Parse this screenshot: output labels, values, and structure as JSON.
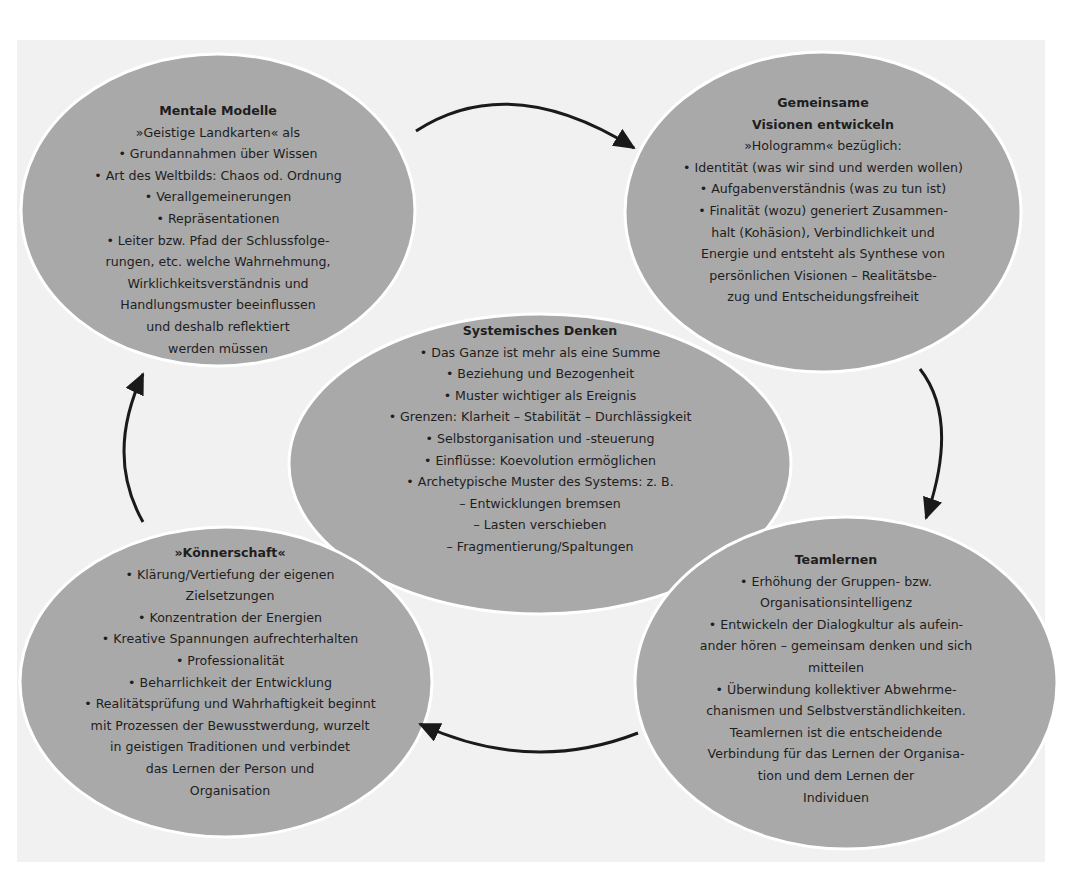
{
  "diagram": {
    "colors": {
      "background": "#f1f1f1",
      "bubble_fill": "#a9a9a9",
      "bubble_outline": "#ffffff",
      "arrow": "#1a1a1a",
      "text": "#1e1e1e"
    },
    "cycle_order": [
      "mental_models",
      "shared_vision",
      "team_learning",
      "personal_mastery"
    ],
    "nodes": {
      "mental_models": {
        "title": "Mentale Modelle",
        "lines": [
          "»Geistige Landkarten« als",
          "• Grundannahmen über Wissen",
          "• Art des Weltbilds: Chaos od. Ordnung",
          "• Verallgemeinerungen",
          "• Repräsentationen",
          "• Leiter bzw. Pfad der Schlussfolge-",
          "rungen, etc. welche Wahrnehmung,",
          "Wirklichkeitsverständnis und",
          "Handlungsmuster beeinflussen",
          "und deshalb reflektiert",
          "werden müssen"
        ]
      },
      "shared_vision": {
        "title_lines": [
          "Gemeinsame",
          "Visionen entwickeln"
        ],
        "lines": [
          "»Hologramm« bezüglich:",
          "• Identität (was wir sind und werden wollen)",
          "• Aufgabenverständnis (was zu tun ist)",
          "• Finalität (wozu) generiert Zusammen-",
          "halt (Kohäsion), Verbindlichkeit und",
          "Energie und entsteht als Synthese von",
          "persönlichen Visionen – Realitätsbe-",
          "zug und Entscheidungsfreiheit"
        ]
      },
      "systems_thinking": {
        "title": "Systemisches Denken",
        "lines": [
          "• Das Ganze ist mehr als eine Summe",
          "• Beziehung und Bezogenheit",
          "• Muster wichtiger als Ereignis",
          "• Grenzen: Klarheit – Stabilität – Durchlässigkeit",
          "• Selbstorganisation und -steuerung",
          "• Einflüsse: Koevolution ermöglichen",
          "• Archetypische Muster des Systems: z. B.",
          "– Entwicklungen bremsen",
          "– Lasten verschieben",
          "– Fragmentierung/Spaltungen"
        ]
      },
      "personal_mastery": {
        "title": "»Könnerschaft«",
        "lines": [
          "• Klärung/Vertiefung der eigenen",
          "Zielsetzungen",
          "• Konzentration der Energien",
          "• Kreative Spannungen aufrechterhalten",
          "• Professionalität",
          "• Beharrlichkeit der Entwicklung",
          "• Realitätsprüfung und Wahrhaftigkeit beginnt",
          "mit Prozessen der Bewusstwerdung, wurzelt",
          "in geistigen Traditionen und verbindet",
          "das Lernen der Person und",
          "Organisation"
        ]
      },
      "team_learning": {
        "title": "Teamlernen",
        "lines": [
          "• Erhöhung der Gruppen- bzw.",
          "Organisationsintelligenz",
          "• Entwickeln der Dialogkultur als aufein-",
          "ander hören – gemeinsam denken und sich",
          "mitteilen",
          "• Überwindung kollektiver Abwehrme-",
          "chanismen und Selbstverständlichkeiten.",
          "Teamlernen ist die entscheidende",
          "Verbindung für das Lernen der Organisa-",
          "tion und dem Lernen der",
          "Individuen"
        ]
      }
    },
    "edges": [
      {
        "from": "mental_models",
        "to": "shared_vision"
      },
      {
        "from": "shared_vision",
        "to": "team_learning"
      },
      {
        "from": "team_learning",
        "to": "personal_mastery"
      },
      {
        "from": "personal_mastery",
        "to": "mental_models"
      }
    ]
  }
}
